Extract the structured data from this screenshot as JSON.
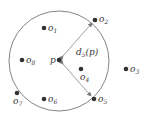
{
  "diagram": {
    "circle": {
      "cx": 59,
      "cy": 61,
      "r": 50,
      "stroke": "#777777"
    },
    "center": {
      "name": "p",
      "x": 59,
      "y": 60
    },
    "distance_label": {
      "base": "d",
      "sub": "5",
      "arg": "(p)"
    },
    "points": [
      {
        "id": "o1",
        "base": "o",
        "sub": "1",
        "x": 44,
        "y": 28
      },
      {
        "id": "o2",
        "base": "o",
        "sub": "2",
        "x": 95,
        "y": 20
      },
      {
        "id": "o3",
        "base": "o",
        "sub": "3",
        "x": 126,
        "y": 69
      },
      {
        "id": "o4",
        "base": "o",
        "sub": "4",
        "x": 81,
        "y": 69
      },
      {
        "id": "o5",
        "base": "o",
        "sub": "5",
        "x": 94,
        "y": 99
      },
      {
        "id": "o6",
        "base": "o",
        "sub": "6",
        "x": 44,
        "y": 99
      },
      {
        "id": "o7",
        "base": "o",
        "sub": "7",
        "x": 17,
        "y": 93
      },
      {
        "id": "o8",
        "base": "o",
        "sub": "8",
        "x": 22,
        "y": 60
      }
    ],
    "colors": {
      "point": "#333333",
      "arrow": "#777777"
    }
  }
}
